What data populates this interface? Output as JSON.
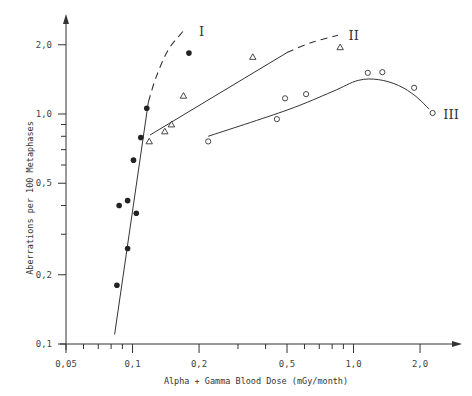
{
  "chart_data": {
    "type": "scatter",
    "title": "",
    "xlabel": "Alpha + Gamma Blood Dose (mGy/month)",
    "ylabel": "Aberrations per 100 Metaphases",
    "xscale": "log",
    "yscale": "log",
    "xlim": [
      0.05,
      2.6
    ],
    "ylim": [
      0.1,
      2.5
    ],
    "x_ticks": [
      {
        "value": 0.05,
        "label": "0,05"
      },
      {
        "value": 0.1,
        "label": "0,1"
      },
      {
        "value": 0.2,
        "label": "0,2"
      },
      {
        "value": 0.5,
        "label": "0,5"
      },
      {
        "value": 1.0,
        "label": "1,0"
      },
      {
        "value": 2.0,
        "label": "2,0"
      }
    ],
    "x_minor_ticks": [
      0.06,
      0.07,
      0.08,
      0.09,
      0.3,
      0.4,
      0.6,
      0.7,
      0.8,
      0.9
    ],
    "y_ticks": [
      {
        "value": 0.1,
        "label": "0,1"
      },
      {
        "value": 0.2,
        "label": "0,2"
      },
      {
        "value": 0.5,
        "label": "0,5"
      },
      {
        "value": 1.0,
        "label": "1,0"
      },
      {
        "value": 2.0,
        "label": "2,0"
      }
    ],
    "y_minor_ticks": [
      0.3,
      0.4,
      0.6,
      0.7,
      0.8,
      0.9
    ],
    "grid": false,
    "series": [
      {
        "name": "I",
        "marker": "filled-circle",
        "points": [
          {
            "x": 0.085,
            "y": 0.18
          },
          {
            "x": 0.087,
            "y": 0.4
          },
          {
            "x": 0.095,
            "y": 0.42
          },
          {
            "x": 0.095,
            "y": 0.26
          },
          {
            "x": 0.104,
            "y": 0.37
          },
          {
            "x": 0.101,
            "y": 0.63
          },
          {
            "x": 0.109,
            "y": 0.79
          },
          {
            "x": 0.116,
            "y": 1.06
          },
          {
            "x": 0.18,
            "y": 1.84
          }
        ],
        "fit_solid": [
          {
            "x": 0.083,
            "y": 0.11
          },
          {
            "x": 0.118,
            "y": 1.13
          }
        ],
        "fit_dashed": [
          {
            "x": 0.118,
            "y": 1.13
          },
          {
            "x": 0.128,
            "y": 1.45
          },
          {
            "x": 0.145,
            "y": 1.9
          },
          {
            "x": 0.17,
            "y": 2.3
          }
        ],
        "label_pos": {
          "x": 0.2,
          "y": 2.3
        }
      },
      {
        "name": "II",
        "marker": "open-triangle",
        "points": [
          {
            "x": 0.119,
            "y": 0.76
          },
          {
            "x": 0.14,
            "y": 0.84
          },
          {
            "x": 0.15,
            "y": 0.9
          },
          {
            "x": 0.17,
            "y": 1.2
          },
          {
            "x": 0.35,
            "y": 1.77
          },
          {
            "x": 0.87,
            "y": 1.95
          }
        ],
        "fit_solid": [
          {
            "x": 0.12,
            "y": 0.81
          },
          {
            "x": 0.5,
            "y": 1.85
          }
        ],
        "fit_dashed": [
          {
            "x": 0.5,
            "y": 1.85
          },
          {
            "x": 0.65,
            "y": 2.05
          },
          {
            "x": 0.85,
            "y": 2.2
          }
        ],
        "label_pos": {
          "x": 0.95,
          "y": 2.2
        }
      },
      {
        "name": "III",
        "marker": "open-circle",
        "points": [
          {
            "x": 0.22,
            "y": 0.76
          },
          {
            "x": 0.45,
            "y": 0.95
          },
          {
            "x": 0.49,
            "y": 1.17
          },
          {
            "x": 0.61,
            "y": 1.22
          },
          {
            "x": 1.16,
            "y": 1.51
          },
          {
            "x": 1.35,
            "y": 1.52
          },
          {
            "x": 1.88,
            "y": 1.3
          },
          {
            "x": 2.28,
            "y": 1.01
          }
        ],
        "fit_solid": [
          {
            "x": 0.22,
            "y": 0.8
          },
          {
            "x": 0.5,
            "y": 1.04
          },
          {
            "x": 0.8,
            "y": 1.25
          },
          {
            "x": 1.05,
            "y": 1.4
          },
          {
            "x": 1.3,
            "y": 1.41
          },
          {
            "x": 1.6,
            "y": 1.33
          },
          {
            "x": 1.9,
            "y": 1.2
          },
          {
            "x": 2.2,
            "y": 1.05
          }
        ],
        "label_pos": {
          "x": 2.55,
          "y": 1.0
        }
      }
    ]
  }
}
